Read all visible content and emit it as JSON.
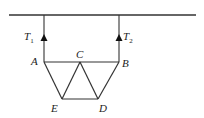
{
  "diagram": {
    "type": "truss suspended by two strings",
    "colors": {
      "line": "#333333",
      "background": "#ffffff"
    },
    "ceiling": {
      "x1": 9,
      "y1": 15,
      "x2": 196,
      "y2": 15
    },
    "strings": [
      {
        "name": "T1",
        "label_main": "T",
        "label_sub": "1",
        "x": 44,
        "y_top": 15,
        "y_bottom": 62,
        "arrow_tip_y": 35
      },
      {
        "name": "T2",
        "label_main": "T",
        "label_sub": "2",
        "x": 119,
        "y_top": 15,
        "y_bottom": 62,
        "arrow_tip_y": 35
      }
    ],
    "nodes": {
      "A": {
        "label": "A",
        "x": 44,
        "y": 62
      },
      "B": {
        "label": "B",
        "x": 119,
        "y": 62
      },
      "C": {
        "label": "C",
        "x": 80,
        "y": 62
      },
      "D": {
        "label": "D",
        "x": 98,
        "y": 99
      },
      "E": {
        "label": "E",
        "x": 62,
        "y": 99
      }
    },
    "members": [
      [
        "A",
        "C"
      ],
      [
        "C",
        "B"
      ],
      [
        "A",
        "E"
      ],
      [
        "E",
        "C"
      ],
      [
        "C",
        "D"
      ],
      [
        "D",
        "B"
      ],
      [
        "E",
        "D"
      ]
    ]
  }
}
